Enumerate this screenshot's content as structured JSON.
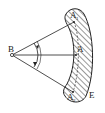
{
  "diagram": {
    "type": "geometry",
    "labels": {
      "point_b": "B",
      "point_a_top": "A",
      "point_a_top_sub": "1",
      "point_a_mid": "A",
      "point_a_bottom": "A",
      "point_a_bottom_sub": "2",
      "region_e": "E"
    },
    "colors": {
      "stroke": "#222222",
      "hatch": "#333333",
      "background": "#ffffff"
    }
  }
}
